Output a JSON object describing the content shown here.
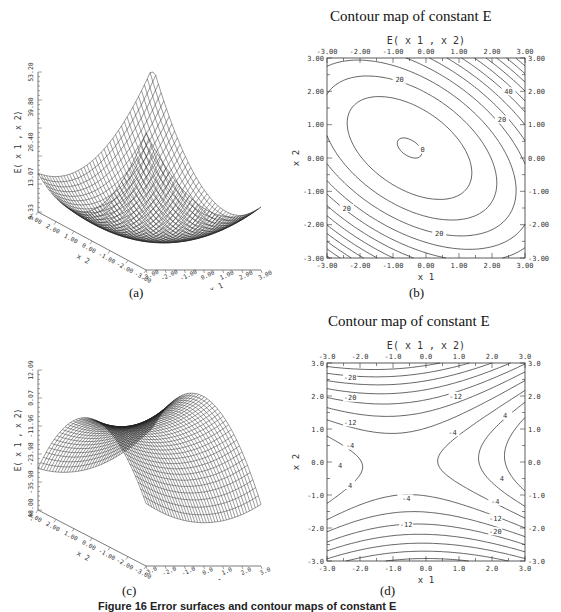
{
  "figure": {
    "panels": {
      "a": {
        "label": "(a)"
      },
      "b": {
        "label": "(b)",
        "title": "Contour map of constant E",
        "plot_title": "E( x 1 , x 2)"
      },
      "c": {
        "label": "(c)"
      },
      "d": {
        "label": "(d)",
        "title": "Contour map of constant E",
        "plot_title": "E( x 1 , x 2)"
      }
    },
    "caption": "Figure 16   Error surfaces and contour maps of constant E"
  },
  "chart_data": [
    {
      "id": "a",
      "type": "surface",
      "title": "",
      "zlabel": "E( x 1 , x 2)",
      "xlabel": "x 1",
      "ylabel": "x 2",
      "x_ticks": [
        "-3.00",
        "-2.00",
        "-1.00",
        "0.00",
        "1.00",
        "2.00",
        "3.00"
      ],
      "y_ticks": [
        "3.00",
        "2.00",
        "1.00",
        "0.00",
        "-1.00",
        "-2.00",
        "-3.00"
      ],
      "z_ticks": [
        "0.33",
        "13.07",
        "26.40",
        "39.80",
        "53.20"
      ],
      "xlim": [
        -3,
        3
      ],
      "ylim": [
        -3,
        3
      ],
      "zlim": [
        0.33,
        53.2
      ],
      "shape": "convex bowl (elliptic paraboloid), minimum near origin"
    },
    {
      "id": "b",
      "type": "contour",
      "title": "Contour map of constant E",
      "plot_title": "E( x 1 , x 2)",
      "xlabel": "x 1",
      "ylabel": "x 2",
      "x_ticks": [
        "-3.00",
        "-2.00",
        "-1.00",
        "0.00",
        "1.00",
        "2.00",
        "3.00"
      ],
      "y_ticks": [
        "-3.00",
        "-2.00",
        "-1.00",
        "0.00",
        "1.00",
        "2.00",
        "3.00"
      ],
      "xlim": [
        -3,
        3
      ],
      "ylim": [
        -3,
        3
      ],
      "contour_labels": [
        {
          "text": "0",
          "x": -0.1,
          "y": 0.25
        },
        {
          "text": "20",
          "x": -0.8,
          "y": 2.35
        },
        {
          "text": "40",
          "x": 2.5,
          "y": 2.0
        },
        {
          "text": "20",
          "x": 2.3,
          "y": 1.15
        },
        {
          "text": "20",
          "x": -2.4,
          "y": -1.5
        },
        {
          "text": "20",
          "x": 0.4,
          "y": -2.25
        }
      ],
      "contour_step": 5,
      "minimum": {
        "x1": -0.5,
        "x2": 0.3
      }
    },
    {
      "id": "c",
      "type": "surface",
      "title": "",
      "zlabel": "E( x 1 , x 2)",
      "xlabel": "x 1",
      "ylabel": "x 2",
      "x_ticks": [
        "-3.0",
        "-2.0",
        "-1.0",
        "0.0",
        "1.0",
        "2.0",
        "3.0"
      ],
      "y_ticks": [
        "3.00",
        "2.00",
        "1.00",
        "0.00",
        "-1.00",
        "-2.00",
        "-3.00"
      ],
      "z_ticks": [
        "-48.00",
        "-35.98",
        "-23.98",
        "-11.96",
        "0.07",
        "12.09"
      ],
      "xlim": [
        -3,
        3
      ],
      "ylim": [
        -3,
        3
      ],
      "zlim": [
        -48.0,
        12.09
      ],
      "shape": "saddle surface"
    },
    {
      "id": "d",
      "type": "contour",
      "title": "Contour map of constant E",
      "plot_title": "E( x 1 , x 2)",
      "xlabel": "x 1",
      "ylabel": "x 2",
      "x_ticks": [
        "-3.0",
        "-2.0",
        "-1.0",
        "0.0",
        "1.0",
        "2.0",
        "3.0"
      ],
      "y_ticks": [
        "-3.0",
        "-2.0",
        "-1.0",
        "0.0",
        "1.0",
        "2.0",
        "3.0"
      ],
      "xlim": [
        -3,
        3
      ],
      "ylim": [
        -3,
        3
      ],
      "contour_labels": [
        {
          "text": "-28",
          "x": -2.3,
          "y": 2.55
        },
        {
          "text": "-20",
          "x": -2.3,
          "y": 1.95
        },
        {
          "text": "-12",
          "x": 0.9,
          "y": 2.0
        },
        {
          "text": "-12",
          "x": -2.3,
          "y": 1.2
        },
        {
          "text": "-4",
          "x": 0.8,
          "y": 0.9
        },
        {
          "text": "-4",
          "x": -2.3,
          "y": 0.5
        },
        {
          "text": "4",
          "x": 2.4,
          "y": 1.4
        },
        {
          "text": "4",
          "x": -2.6,
          "y": -0.1
        },
        {
          "text": "4",
          "x": 2.3,
          "y": -0.5
        },
        {
          "text": "4",
          "x": -2.3,
          "y": -0.7
        },
        {
          "text": "-4",
          "x": -0.6,
          "y": -1.1
        },
        {
          "text": "-4",
          "x": 2.1,
          "y": -1.2
        },
        {
          "text": "-12",
          "x": -0.6,
          "y": -1.9
        },
        {
          "text": "-12",
          "x": 2.1,
          "y": -1.7
        },
        {
          "text": "-20",
          "x": 2.1,
          "y": -2.1
        }
      ],
      "contour_step": 4,
      "saddle": {
        "x1": -0.8,
        "x2": 0.0
      }
    }
  ]
}
